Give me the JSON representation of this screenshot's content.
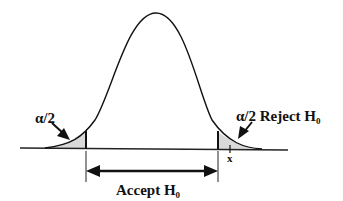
{
  "diagram": {
    "type": "two-tailed normal distribution hypothesis test",
    "left_tail_label": "α/2",
    "right_tail_label": "α/2 Reject H",
    "right_tail_label_sub": "0",
    "accept_label": "Accept H",
    "accept_label_sub": "0",
    "x_marker_label": "x",
    "colors": {
      "curve": "#111111",
      "shade": "#d9d9d9",
      "background": "#ffffff"
    }
  }
}
